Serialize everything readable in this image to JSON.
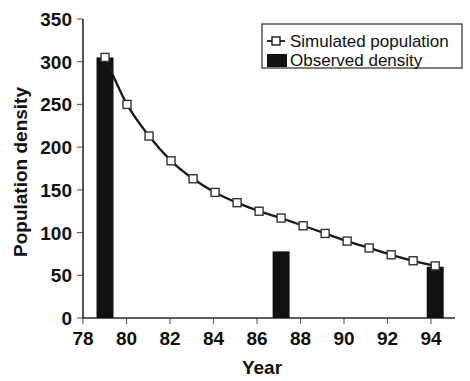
{
  "chart_data": {
    "type": "line",
    "title": "",
    "xlabel": "Year",
    "ylabel": "Population density",
    "xlim": [
      78,
      94.9
    ],
    "ylim": [
      0,
      350
    ],
    "xticks": [
      78,
      80,
      82,
      84,
      86,
      88,
      90,
      92,
      94
    ],
    "yticks": [
      0,
      50,
      100,
      150,
      200,
      250,
      300,
      350
    ],
    "grid": false,
    "legend_position": "top-right",
    "series": [
      {
        "name": "Simulated population",
        "type": "line",
        "marker": "square-open",
        "x": [
          79,
          80,
          81,
          82,
          83,
          84,
          85,
          86,
          87,
          88,
          89,
          90,
          91,
          92,
          93,
          94
        ],
        "values": [
          305,
          250,
          213,
          184,
          163,
          147,
          135,
          125,
          117,
          108,
          99,
          90,
          82,
          74,
          67,
          61
        ]
      },
      {
        "name": "Observed density",
        "type": "bar",
        "x": [
          79,
          87,
          94
        ],
        "values": [
          305,
          78,
          60
        ]
      }
    ]
  },
  "axes": {
    "x_title": "Year",
    "y_title": "Population density",
    "x_tick_labels": [
      "78",
      "80",
      "82",
      "84",
      "86",
      "88",
      "90",
      "92",
      "94"
    ],
    "y_tick_labels": [
      "0",
      "50",
      "100",
      "150",
      "200",
      "250",
      "300",
      "350"
    ]
  },
  "legend": {
    "items": [
      {
        "label": "Simulated population",
        "swatch": "open-square-on-line",
        "color": "#1a1a1a"
      },
      {
        "label": "Observed density",
        "swatch": "filled-rectangle",
        "color": "#111111"
      }
    ]
  },
  "colors": {
    "line": "#1a1a1a",
    "bar": "#111111",
    "axis": "#2b2b2b",
    "text": "#111111",
    "background": "#ffffff"
  }
}
